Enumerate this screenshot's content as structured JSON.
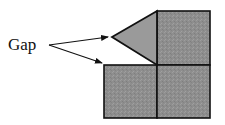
{
  "diagram": {
    "label": "Gap",
    "colors": {
      "fill": "#8e8e8e",
      "triangle_fill": "#9a9a9a",
      "stroke": "#111111",
      "background": "#ffffff"
    },
    "shapes": {
      "squares": [
        "top-right-square",
        "bottom-left-square",
        "bottom-right-square"
      ],
      "triangle": "wedge-triangle"
    },
    "arrows": [
      "arrow-to-triangle-tip",
      "arrow-to-bottom-left-square"
    ]
  }
}
